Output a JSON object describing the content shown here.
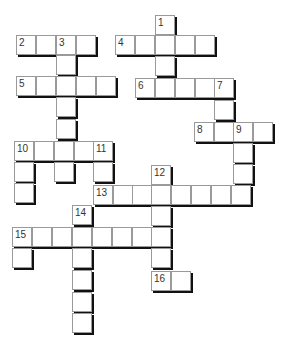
{
  "puzzle": {
    "type": "crossword",
    "cell_size": 20,
    "cells": [
      {
        "x": 155,
        "y": 15,
        "n": "1"
      },
      {
        "x": 16,
        "y": 35,
        "n": "2"
      },
      {
        "x": 36,
        "y": 35
      },
      {
        "x": 56,
        "y": 35,
        "n": "3"
      },
      {
        "x": 76,
        "y": 35
      },
      {
        "x": 115,
        "y": 35,
        "n": "4"
      },
      {
        "x": 135,
        "y": 35
      },
      {
        "x": 155,
        "y": 35
      },
      {
        "x": 175,
        "y": 35
      },
      {
        "x": 195,
        "y": 35
      },
      {
        "x": 56,
        "y": 55
      },
      {
        "x": 155,
        "y": 56
      },
      {
        "x": 16,
        "y": 76,
        "n": "5"
      },
      {
        "x": 36,
        "y": 76
      },
      {
        "x": 56,
        "y": 76
      },
      {
        "x": 76,
        "y": 76
      },
      {
        "x": 96,
        "y": 76
      },
      {
        "x": 135,
        "y": 78,
        "n": "6"
      },
      {
        "x": 155,
        "y": 78
      },
      {
        "x": 175,
        "y": 78
      },
      {
        "x": 195,
        "y": 78
      },
      {
        "x": 214,
        "y": 78,
        "n": "7"
      },
      {
        "x": 56,
        "y": 97
      },
      {
        "x": 214,
        "y": 100
      },
      {
        "x": 56,
        "y": 119
      },
      {
        "x": 194,
        "y": 122,
        "n": "8"
      },
      {
        "x": 214,
        "y": 122
      },
      {
        "x": 233,
        "y": 122,
        "n": "9"
      },
      {
        "x": 253,
        "y": 122
      },
      {
        "x": 14,
        "y": 141,
        "n": "10"
      },
      {
        "x": 34,
        "y": 141
      },
      {
        "x": 54,
        "y": 141
      },
      {
        "x": 74,
        "y": 141
      },
      {
        "x": 93,
        "y": 141,
        "n": "11"
      },
      {
        "x": 233,
        "y": 143
      },
      {
        "x": 14,
        "y": 162
      },
      {
        "x": 54,
        "y": 162
      },
      {
        "x": 93,
        "y": 162
      },
      {
        "x": 151,
        "y": 165,
        "n": "12"
      },
      {
        "x": 233,
        "y": 164
      },
      {
        "x": 14,
        "y": 183
      },
      {
        "x": 93,
        "y": 185,
        "n": "13"
      },
      {
        "x": 113,
        "y": 185
      },
      {
        "x": 132,
        "y": 185
      },
      {
        "x": 151,
        "y": 185
      },
      {
        "x": 171,
        "y": 185
      },
      {
        "x": 191,
        "y": 185
      },
      {
        "x": 211,
        "y": 185
      },
      {
        "x": 231,
        "y": 185
      },
      {
        "x": 72,
        "y": 205,
        "n": "14"
      },
      {
        "x": 151,
        "y": 206
      },
      {
        "x": 12,
        "y": 227,
        "n": "15"
      },
      {
        "x": 32,
        "y": 227
      },
      {
        "x": 52,
        "y": 227
      },
      {
        "x": 72,
        "y": 227
      },
      {
        "x": 92,
        "y": 227
      },
      {
        "x": 112,
        "y": 227
      },
      {
        "x": 132,
        "y": 227
      },
      {
        "x": 151,
        "y": 227
      },
      {
        "x": 12,
        "y": 248
      },
      {
        "x": 72,
        "y": 248
      },
      {
        "x": 151,
        "y": 248
      },
      {
        "x": 72,
        "y": 270
      },
      {
        "x": 151,
        "y": 271,
        "n": "16"
      },
      {
        "x": 171,
        "y": 271
      },
      {
        "x": 72,
        "y": 292
      },
      {
        "x": 72,
        "y": 313
      }
    ]
  }
}
